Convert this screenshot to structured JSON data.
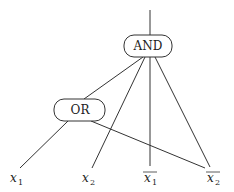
{
  "diagram": {
    "type": "boolean-circuit",
    "nodes": {
      "and": {
        "label": "AND"
      },
      "or": {
        "label": "OR"
      }
    },
    "inputs": [
      {
        "id": "x1",
        "base": "x",
        "sub": "1",
        "negated": false
      },
      {
        "id": "x2",
        "base": "x",
        "sub": "2",
        "negated": false
      },
      {
        "id": "nx1",
        "base": "x",
        "sub": "1",
        "negated": true
      },
      {
        "id": "nx2",
        "base": "x",
        "sub": "2",
        "negated": true
      }
    ],
    "edges": [
      {
        "from": "and",
        "to": "output"
      },
      {
        "from": "or",
        "to": "and"
      },
      {
        "from": "x2",
        "to": "and"
      },
      {
        "from": "nx1",
        "to": "and"
      },
      {
        "from": "nx2",
        "to": "and"
      },
      {
        "from": "x1",
        "to": "or"
      },
      {
        "from": "nx2",
        "to": "or"
      }
    ]
  }
}
